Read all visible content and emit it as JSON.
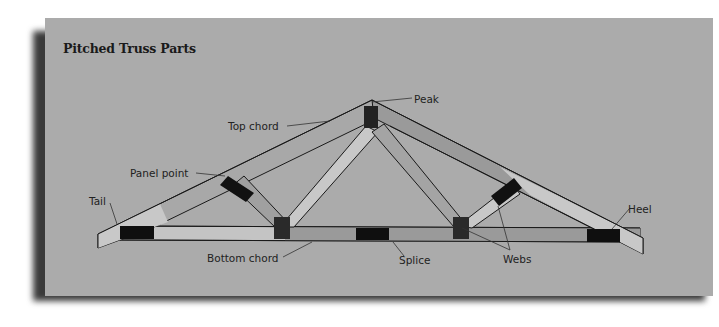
{
  "diagram": {
    "title": "Pitched Truss Parts",
    "labels": {
      "peak": "Peak",
      "top_chord": "Top chord",
      "panel_point": "Panel point",
      "tail": "Tail",
      "heel": "Heel",
      "bottom_chord": "Bottom chord",
      "splice": "Splice",
      "webs": "Webs"
    },
    "colors": {
      "background": "#ababab",
      "member_light": "#c8c8c8",
      "member_mid": "#969696",
      "plate": "#111111",
      "outline": "#1a1a1a"
    }
  }
}
